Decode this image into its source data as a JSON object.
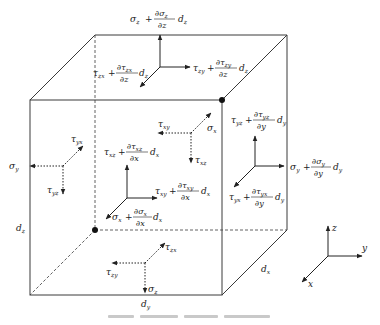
{
  "diagram": {
    "caption": "",
    "colors": {
      "line": "#3a3a3a",
      "text": "#222222",
      "background": "#ffffff"
    },
    "cube": {
      "front_face": {
        "tl": [
          30,
          100
        ],
        "tr": [
          222,
          100
        ],
        "bl": [
          30,
          295
        ],
        "br": [
          222,
          295
        ]
      },
      "back_face": {
        "tl": [
          95,
          35
        ],
        "tr": [
          287,
          35
        ],
        "br": [
          287,
          230
        ],
        "bl_hidden": [
          95,
          230
        ]
      },
      "nodes": [
        {
          "id": "corner-top-right",
          "at": [
            222,
            100
          ]
        },
        {
          "id": "hidden-corner",
          "at": [
            95,
            230
          ]
        }
      ],
      "dimensions": {
        "left_edge": "d",
        "left_edge_sub": "z",
        "bottom_edge": "d",
        "bottom_edge_sub": "y",
        "depth_edge": "d",
        "depth_edge_sub": "x"
      }
    },
    "labels": {
      "top_normal": {
        "base": "σ",
        "sub": "z",
        "plus": "+",
        "num": "∂σ",
        "num_sub": "z",
        "den": "∂z",
        "d": "d",
        "d_sub": "z"
      },
      "top_shear_x": {
        "base": "τ",
        "sub": "zx",
        "plus": "+",
        "num": "∂τ",
        "num_sub": "zx",
        "den": "∂z",
        "d": "d",
        "d_sub": "z"
      },
      "top_shear_y": {
        "base": "τ",
        "sub": "zy",
        "plus": "+",
        "num": "∂τ",
        "num_sub": "zy",
        "den": "∂z",
        "d": "d",
        "d_sub": "z"
      },
      "front_shear_z": {
        "base": "τ",
        "sub": "xz",
        "plus": "+",
        "num": "∂τ",
        "num_sub": "xz",
        "den": "∂x",
        "d": "d",
        "d_sub": "x"
      },
      "front_shear_y": {
        "base": "τ",
        "sub": "xy",
        "plus": "+",
        "num": "∂τ",
        "num_sub": "xy",
        "den": "∂x",
        "d": "d",
        "d_sub": "x"
      },
      "front_normal": {
        "base": "σ",
        "sub": "x",
        "plus": "+",
        "num": "∂σ",
        "num_sub": "x",
        "den": "∂x",
        "d": "d",
        "d_sub": "x"
      },
      "right_shear_z": {
        "base": "τ",
        "sub": "yz",
        "plus": "+",
        "num": "∂τ",
        "num_sub": "yz",
        "den": "∂y",
        "d": "d",
        "d_sub": "y"
      },
      "right_normal": {
        "base": "σ",
        "sub": "y",
        "plus": "+",
        "num": "∂σ",
        "num_sub": "y",
        "den": "∂y",
        "d": "d",
        "d_sub": "y"
      },
      "right_shear_x": {
        "base": "τ",
        "sub": "yx",
        "plus": "+",
        "num": "∂τ",
        "num_sub": "yx",
        "den": "∂y",
        "d": "d",
        "d_sub": "y"
      },
      "back_tau_xy": {
        "base": "τ",
        "sub": "xy"
      },
      "back_sigma_x": {
        "base": "σ",
        "sub": "x"
      },
      "back_tau_xz": {
        "base": "τ",
        "sub": "xz"
      },
      "left_sigma_y": {
        "base": "σ",
        "sub": "y"
      },
      "left_tau_yx": {
        "base": "τ",
        "sub": "yx"
      },
      "left_tau_yz": {
        "base": "τ",
        "sub": "yz"
      },
      "bottom_tau_zx": {
        "base": "τ",
        "sub": "zx"
      },
      "bottom_tau_zy": {
        "base": "τ",
        "sub": "zy"
      },
      "bottom_sigma_z": {
        "base": "σ",
        "sub": "z"
      }
    },
    "axes": {
      "x": "x",
      "y": "y",
      "z": "z",
      "origin": [
        328,
        256
      ]
    }
  }
}
